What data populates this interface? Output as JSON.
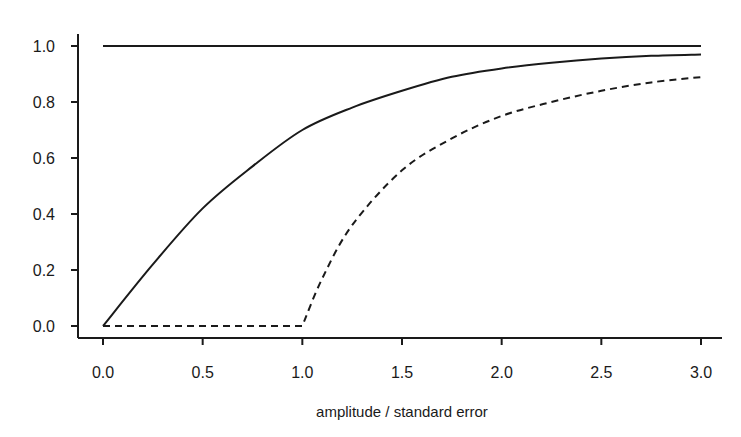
{
  "chart_data": {
    "type": "line",
    "title": "",
    "xlabel": "amplitude / standard error",
    "ylabel": "",
    "xlim": [
      0.0,
      3.0
    ],
    "ylim": [
      0.0,
      1.0
    ],
    "grid": false,
    "legend": null,
    "x_ticks": [
      "0.0",
      "0.5",
      "1.0",
      "1.5",
      "2.0",
      "2.5",
      "3.0"
    ],
    "y_ticks": [
      "0.0",
      "0.2",
      "0.4",
      "0.6",
      "0.8",
      "1.0"
    ],
    "series": [
      {
        "name": "upper bound (constant)",
        "style": "solid",
        "x": [
          0.0,
          3.0
        ],
        "y": [
          1.0,
          1.0
        ]
      },
      {
        "name": "solid curve",
        "style": "solid",
        "x": [
          0.0,
          0.25,
          0.5,
          0.75,
          1.0,
          1.25,
          1.5,
          1.75,
          2.0,
          2.25,
          2.5,
          2.75,
          3.0
        ],
        "y": [
          0.0,
          0.22,
          0.42,
          0.57,
          0.7,
          0.78,
          0.84,
          0.89,
          0.92,
          0.94,
          0.955,
          0.965,
          0.97
        ]
      },
      {
        "name": "dashed curve",
        "style": "dashed",
        "x": [
          0.0,
          1.0,
          1.1,
          1.25,
          1.5,
          1.75,
          2.0,
          2.25,
          2.5,
          2.75,
          3.0
        ],
        "y": [
          0.0,
          0.0,
          0.17,
          0.36,
          0.556,
          0.67,
          0.75,
          0.8,
          0.84,
          0.87,
          0.889
        ]
      }
    ]
  },
  "axes": {
    "x_label": "amplitude / standard error"
  }
}
